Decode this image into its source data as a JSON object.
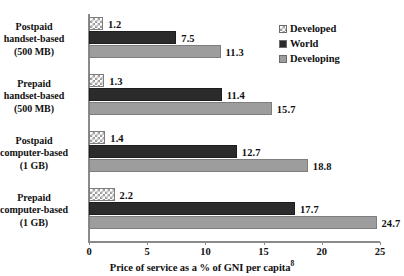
{
  "chart_data": {
    "type": "bar",
    "orientation": "horizontal",
    "title": "",
    "subtitle": "",
    "xlabel": "Price of service as a % of GNI per capita",
    "xlabel_footnote": "8",
    "ylabel": "",
    "xlim": [
      0,
      25
    ],
    "xticks": [
      0,
      5,
      10,
      15,
      20,
      25
    ],
    "xtick_labels": [
      "0",
      "5",
      "10",
      "15",
      "20",
      "25"
    ],
    "grid": false,
    "legend_position": "top-right",
    "categories": [
      "Postpaid\nhandset-based\n(500 MB)",
      "Prepaid\nhandset-based\n(500 MB)",
      "Postpaid\ncomputer-based\n(1 GB)",
      "Prepaid\ncomputer-based\n(1 GB)"
    ],
    "category_lines": [
      [
        "Postpaid",
        "handset-based",
        "(500 MB)"
      ],
      [
        "Prepaid",
        "handset-based",
        "(500 MB)"
      ],
      [
        "Postpaid",
        "computer-based",
        "(1 GB)"
      ],
      [
        "Prepaid",
        "computer-based",
        "(1 GB)"
      ]
    ],
    "series": [
      {
        "name": "Developed",
        "pattern": "checkered",
        "color": "#9a9a9a",
        "values": [
          1.2,
          1.3,
          1.4,
          2.2
        ],
        "value_labels": [
          "1.2",
          "1.3",
          "1.4",
          "2.2"
        ]
      },
      {
        "name": "World",
        "pattern": "solid",
        "color": "#2b2b2b",
        "values": [
          7.5,
          11.4,
          12.7,
          17.7
        ],
        "value_labels": [
          "7.5",
          "11.4",
          "12.7",
          "17.7"
        ]
      },
      {
        "name": "Developing",
        "pattern": "solid",
        "color": "#9d9d9d",
        "values": [
          11.3,
          15.7,
          18.8,
          24.7
        ],
        "value_labels": [
          "11.3",
          "15.7",
          "18.8",
          "24.7"
        ]
      }
    ]
  },
  "legend": {
    "items": [
      {
        "label": "Developed"
      },
      {
        "label": "World"
      },
      {
        "label": "Developing"
      }
    ]
  },
  "axis": {
    "x_title_text": "Price of service as a % of GNI per capita",
    "x_title_footnote": "8",
    "tick_labels": [
      "0",
      "5",
      "10",
      "15",
      "20",
      "25"
    ]
  }
}
